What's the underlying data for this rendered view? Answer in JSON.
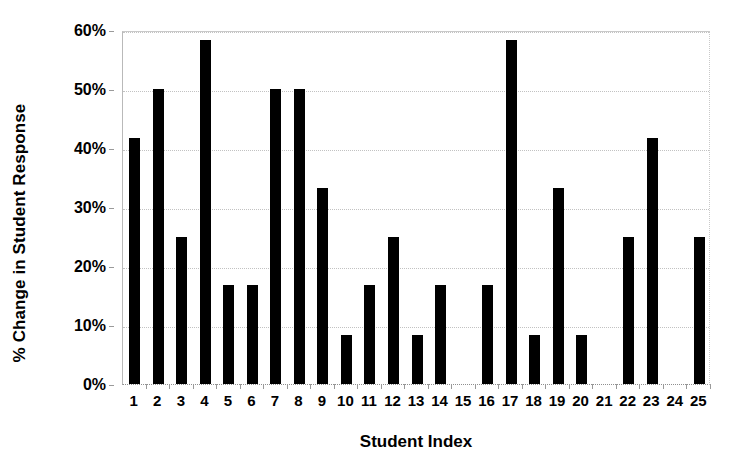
{
  "chart_data": {
    "type": "bar",
    "title": "",
    "xlabel": "Student Index",
    "ylabel": "% Change in Student Response",
    "categories": [
      "1",
      "2",
      "3",
      "4",
      "5",
      "6",
      "7",
      "8",
      "9",
      "10",
      "11",
      "12",
      "13",
      "14",
      "15",
      "16",
      "17",
      "18",
      "19",
      "20",
      "21",
      "22",
      "23",
      "24",
      "25"
    ],
    "values": [
      41.7,
      50.0,
      25.0,
      58.3,
      16.7,
      16.7,
      50.0,
      50.0,
      33.3,
      8.3,
      16.7,
      25.0,
      8.3,
      16.7,
      0,
      16.7,
      58.3,
      8.3,
      33.3,
      8.3,
      0,
      25.0,
      41.7,
      0,
      25.0
    ],
    "ylim": [
      0,
      60
    ],
    "ytick_values": [
      0,
      10,
      20,
      30,
      40,
      50,
      60
    ],
    "ytick_labels": [
      "0%",
      "10%",
      "20%",
      "30%",
      "40%",
      "50%",
      "60%"
    ],
    "grid": true,
    "legend": "none",
    "series_color": "#000000"
  }
}
